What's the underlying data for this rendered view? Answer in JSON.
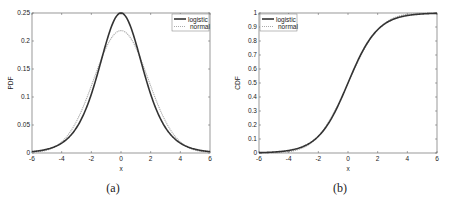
{
  "chart_data": [
    {
      "type": "line",
      "panel": "a",
      "caption": "(a)",
      "xlabel": "x",
      "ylabel": "PDF",
      "xlim": [
        -6,
        6
      ],
      "ylim": [
        0,
        0.25
      ],
      "xticks": [
        -6,
        -4,
        -2,
        0,
        2,
        4,
        6
      ],
      "xtick_labels": [
        "-6",
        "-4",
        "-2",
        "0",
        "2",
        "4",
        "6"
      ],
      "yticks": [
        0,
        0.05,
        0.1,
        0.15,
        0.2,
        0.25
      ],
      "ytick_labels": [
        "0",
        "0.05",
        "0.1",
        "0.15",
        "0.2",
        "0.25"
      ],
      "grid": false,
      "legend_position": "upper right",
      "x": [
        -6,
        -5,
        -4,
        -3,
        -2,
        -1.5,
        -1,
        -0.5,
        0,
        0.5,
        1,
        1.5,
        2,
        3,
        4,
        5,
        6
      ],
      "series": [
        {
          "name": "logistic",
          "style": "solid",
          "color": "#333333",
          "values": [
            0.0025,
            0.0066,
            0.0177,
            0.0452,
            0.105,
            0.149,
            0.197,
            0.235,
            0.25,
            0.235,
            0.197,
            0.149,
            0.105,
            0.0452,
            0.0177,
            0.0066,
            0.0025
          ]
        },
        {
          "name": "normal",
          "style": "dotted",
          "color": "#aaaaaa",
          "values": [
            0.0006,
            0.0027,
            0.0101,
            0.0307,
            0.0717,
            0.0998,
            0.1305,
            0.1584,
            0.2185,
            0.1584,
            0.1305,
            0.0998,
            0.0717,
            0.0307,
            0.0101,
            0.0027,
            0.0006
          ]
        }
      ]
    },
    {
      "type": "line",
      "panel": "b",
      "caption": "(b)",
      "xlabel": "x",
      "ylabel": "CDF",
      "xlim": [
        -6,
        6
      ],
      "ylim": [
        0,
        1
      ],
      "xticks": [
        -6,
        -4,
        -2,
        0,
        2,
        4,
        6
      ],
      "xtick_labels": [
        "-6",
        "-4",
        "-2",
        "0",
        "2",
        "4",
        "6"
      ],
      "yticks": [
        0,
        0.1,
        0.2,
        0.3,
        0.4,
        0.5,
        0.6,
        0.7,
        0.8,
        0.9,
        1
      ],
      "ytick_labels": [
        "0",
        "0.1",
        "0.2",
        "0.3",
        "0.4",
        "0.5",
        "0.6",
        "0.7",
        "0.8",
        "0.9",
        "1"
      ],
      "grid": false,
      "legend_position": "upper left",
      "x": [
        -6,
        -5,
        -4,
        -3,
        -2,
        -1,
        0,
        1,
        2,
        3,
        4,
        5,
        6
      ],
      "series": [
        {
          "name": "logistic",
          "style": "solid",
          "color": "#333333",
          "values": [
            0.0025,
            0.0067,
            0.018,
            0.047,
            0.119,
            0.269,
            0.5,
            0.731,
            0.881,
            0.953,
            0.982,
            0.9933,
            0.9975
          ]
        },
        {
          "name": "normal",
          "style": "dotted",
          "color": "#aaaaaa",
          "values": [
            0.0003,
            0.0017,
            0.0079,
            0.0334,
            0.1103,
            0.2701,
            0.5,
            0.7299,
            0.8897,
            0.9666,
            0.9921,
            0.9983,
            0.9997
          ]
        }
      ]
    }
  ]
}
